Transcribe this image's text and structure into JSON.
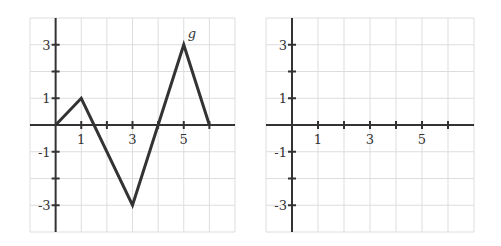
{
  "chart_data": [
    {
      "type": "line",
      "title": "",
      "series": [
        {
          "name": "g",
          "x": [
            0,
            1,
            3,
            5,
            6
          ],
          "y": [
            0,
            1,
            -3,
            3,
            0
          ]
        }
      ],
      "function_label": "g",
      "xlim": [
        -1,
        7
      ],
      "ylim": [
        -4,
        4
      ],
      "x_tick_labels": [
        "1",
        "3",
        "5"
      ],
      "y_tick_labels": [
        "3",
        "1",
        "-1",
        "-3"
      ],
      "grid": true
    },
    {
      "type": "line",
      "title": "",
      "series": [],
      "xlim": [
        -1,
        7
      ],
      "ylim": [
        -4,
        4
      ],
      "x_tick_labels": [
        "1",
        "3",
        "5"
      ],
      "y_tick_labels": [
        "3",
        "1",
        "-1",
        "-3"
      ],
      "grid": true
    }
  ],
  "colors": {
    "grid": "#dddddd",
    "axis": "#333333",
    "line": "#333333"
  }
}
